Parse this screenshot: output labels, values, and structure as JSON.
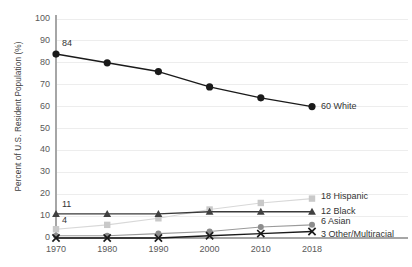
{
  "chart_data": {
    "type": "line",
    "title": "",
    "xlabel": "",
    "ylabel": "Percent of U.S. Resident Population (%)",
    "x": [
      1970,
      1980,
      1990,
      2000,
      2010,
      2018
    ],
    "xticklabels": [
      "1970",
      "1980",
      "1990",
      "2000",
      "2010",
      "2018"
    ],
    "yticklabels": [
      "0",
      "10",
      "20",
      "30",
      "40",
      "50",
      "60",
      "70",
      "80",
      "90",
      "100"
    ],
    "yticks": [
      0,
      10,
      20,
      30,
      40,
      50,
      60,
      70,
      80,
      90,
      100
    ],
    "ylim": [
      0,
      100
    ],
    "xlim": [
      1970,
      2018
    ],
    "grid": "horizontal",
    "legend": "inline-end-labels",
    "series": [
      {
        "name": "White",
        "values": [
          84,
          80,
          76,
          69,
          64,
          60
        ],
        "marker": "circle",
        "color": "#1a1a1a",
        "line_color": "#1a1a1a",
        "end_label": "60 White",
        "start_label": "84"
      },
      {
        "name": "Hispanic",
        "values": [
          4,
          6,
          9,
          13,
          16,
          18
        ],
        "marker": "square",
        "color": "#c9c9c9",
        "line_color": "#d8d8d8",
        "end_label": "18 Hispanic",
        "start_label": "4"
      },
      {
        "name": "Black",
        "values": [
          11,
          11,
          11,
          12,
          12,
          12
        ],
        "marker": "triangle",
        "color": "#404040",
        "line_color": "#3a3a3a",
        "end_label": "12 Black",
        "start_label": "11"
      },
      {
        "name": "Asian",
        "values": [
          1,
          1,
          2,
          3,
          5,
          6
        ],
        "marker": "circle-gray",
        "color": "#8c8c8c",
        "line_color": "#9a9a9a",
        "end_label": "6 Asian",
        "start_label": ""
      },
      {
        "name": "Other/Multiracial",
        "values": [
          0,
          0,
          0,
          1,
          2,
          3
        ],
        "marker": "x",
        "color": "#1a1a1a",
        "line_color": "#1a1a1a",
        "end_label": "3 Other/Multiracial",
        "start_label": ""
      }
    ],
    "colors": {
      "axis": "#a6a6a6",
      "grid": "#ededed",
      "text": "#595959",
      "background": "#ffffff"
    }
  }
}
